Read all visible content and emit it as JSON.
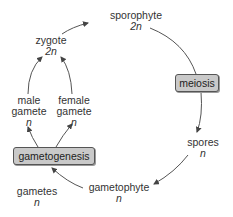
{
  "diagram": {
    "type": "life-cycle",
    "nodes": {
      "sporophyte": {
        "name": "sporophyte",
        "ploidy": "2n"
      },
      "meiosis": {
        "name": "meiosis"
      },
      "spores": {
        "name": "spores",
        "ploidy": "n"
      },
      "gametophyte": {
        "name": "gametophyte",
        "ploidy": "n"
      },
      "gametogenesis": {
        "name": "gametogenesis"
      },
      "gametes": {
        "name": "gametes",
        "ploidy": "n"
      },
      "male_gamete": {
        "name_line1": "male",
        "name_line2": "gamete",
        "ploidy": "n"
      },
      "female_gamete": {
        "name_line1": "female",
        "name_line2": "gamete",
        "ploidy": "n"
      },
      "zygote": {
        "name": "zygote",
        "ploidy": "2n"
      }
    },
    "edges": [
      {
        "from": "sporophyte",
        "to": "meiosis"
      },
      {
        "from": "meiosis",
        "to": "spores"
      },
      {
        "from": "spores",
        "to": "gametophyte"
      },
      {
        "from": "gametophyte",
        "to": "gametogenesis"
      },
      {
        "from": "gametogenesis",
        "to": "male_gamete"
      },
      {
        "from": "gametogenesis",
        "to": "female_gamete"
      },
      {
        "from": "male_gamete",
        "to": "zygote"
      },
      {
        "from": "female_gamete",
        "to": "zygote"
      },
      {
        "from": "zygote",
        "to": "sporophyte"
      }
    ],
    "colors": {
      "box_fill": "#c9c9c9",
      "box_border": "#555555",
      "line": "#555555",
      "text": "#333333"
    }
  }
}
